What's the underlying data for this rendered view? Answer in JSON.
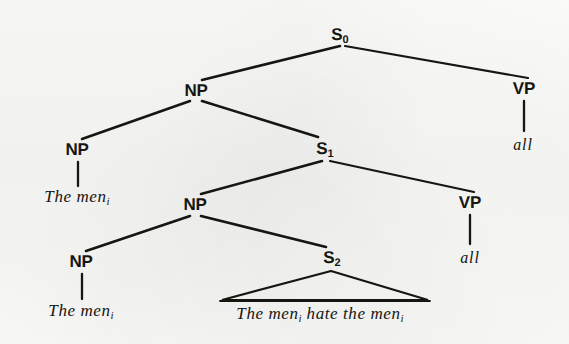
{
  "figure": {
    "type": "syntax-tree",
    "ink_color": "#16150f",
    "background_color": "#f8f8f7"
  },
  "nodes": {
    "s0": {
      "label": "S",
      "subscript": "0",
      "x": 340,
      "y": 36
    },
    "np_top": {
      "label": "NP",
      "subscript": "",
      "x": 196,
      "y": 91
    },
    "vp_top": {
      "label": "VP",
      "subscript": "",
      "x": 524,
      "y": 89
    },
    "np_mid_left": {
      "label": "NP",
      "subscript": "",
      "x": 77,
      "y": 150
    },
    "s1": {
      "label": "S",
      "subscript": "1",
      "x": 325,
      "y": 150
    },
    "np_mid": {
      "label": "NP",
      "subscript": "",
      "x": 195,
      "y": 205
    },
    "vp_mid": {
      "label": "VP",
      "subscript": "",
      "x": 470,
      "y": 203
    },
    "np_low_left": {
      "label": "NP",
      "subscript": "",
      "x": 81,
      "y": 262
    },
    "s2": {
      "label": "S",
      "subscript": "2",
      "x": 332,
      "y": 259
    }
  },
  "terminals": {
    "the_men_1": {
      "text": "The men",
      "subscript": "i",
      "x": 77,
      "y": 197
    },
    "all_1": {
      "text": "all",
      "subscript": "",
      "x": 523,
      "y": 145
    },
    "the_men_2": {
      "text": "The men",
      "subscript": "i",
      "x": 81,
      "y": 311
    },
    "all_2": {
      "text": "all",
      "subscript": "",
      "x": 470,
      "y": 258
    },
    "sentence": {
      "text": "The men",
      "subscript": "i",
      "text2": " hate the men",
      "subscript2": "i",
      "x": 320,
      "y": 314
    }
  },
  "edges": [
    {
      "name": "s0-to-np",
      "x1": 340,
      "y1": 46,
      "x2": 202,
      "y2": 80
    },
    {
      "name": "s0-to-vp",
      "x1": 345,
      "y1": 46,
      "x2": 528,
      "y2": 78
    },
    {
      "name": "np-to-np",
      "x1": 190,
      "y1": 101,
      "x2": 82,
      "y2": 139
    },
    {
      "name": "np-to-s1",
      "x1": 202,
      "y1": 101,
      "x2": 318,
      "y2": 137
    },
    {
      "name": "vp-to-all-1",
      "x1": 524,
      "y1": 101,
      "x2": 524,
      "y2": 132
    },
    {
      "name": "np-to-themen-1",
      "x1": 78,
      "y1": 162,
      "x2": 78,
      "y2": 186
    },
    {
      "name": "s1-to-np",
      "x1": 322,
      "y1": 161,
      "x2": 201,
      "y2": 194
    },
    {
      "name": "s1-to-vp",
      "x1": 330,
      "y1": 161,
      "x2": 474,
      "y2": 192
    },
    {
      "name": "np-to-np-2",
      "x1": 190,
      "y1": 216,
      "x2": 86,
      "y2": 251
    },
    {
      "name": "np-to-s2",
      "x1": 201,
      "y1": 216,
      "x2": 326,
      "y2": 247
    },
    {
      "name": "vp-to-all-2",
      "x1": 470,
      "y1": 215,
      "x2": 470,
      "y2": 245
    },
    {
      "name": "np-to-themen-2",
      "x1": 82,
      "y1": 274,
      "x2": 82,
      "y2": 300
    }
  ],
  "triangle": {
    "name": "s2-yield-triangle",
    "apex_x": 331,
    "apex_y": 271,
    "left_x": 222,
    "right_x": 428,
    "base_y": 300
  }
}
